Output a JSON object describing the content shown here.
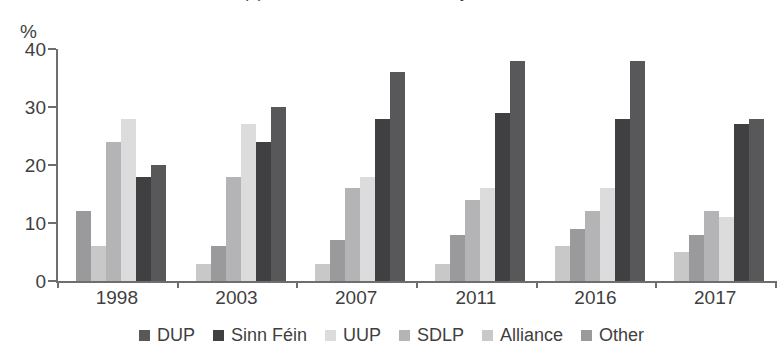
{
  "title": {
    "clipped_text": "(b) Northern Ireland Assembly elections"
  },
  "axis": {
    "y_unit_label": "%",
    "y_ticks": [
      "0",
      "10",
      "20",
      "30",
      "40"
    ],
    "x_ticks": [
      "1998",
      "2003",
      "2007",
      "2011",
      "2016",
      "2017"
    ]
  },
  "legend": {
    "items": [
      {
        "label": "DUP",
        "color": "#58585a"
      },
      {
        "label": "Sinn Féin",
        "color": "#403f41"
      },
      {
        "label": "UUP",
        "color": "#dcdcdc"
      },
      {
        "label": "SDLP",
        "color": "#b4b4b6"
      },
      {
        "label": "Alliance",
        "color": "#c8c8c8"
      },
      {
        "label": "Other",
        "color": "#9a9a9c"
      }
    ]
  },
  "chart_data": {
    "type": "bar",
    "title": "(b) Northern Ireland Assembly elections",
    "xlabel": "",
    "ylabel": "%",
    "ylim": [
      0,
      40
    ],
    "grid": false,
    "legend_position": "bottom",
    "categories": [
      "1998",
      "2003",
      "2007",
      "2011",
      "2016",
      "2017"
    ],
    "series": [
      {
        "name": "DUP",
        "color": "#58585a",
        "values": [
          18,
          26,
          30,
          30,
          29,
          28
        ]
      },
      {
        "name": "Sinn Féin",
        "color": "#403f41",
        "values": [
          17,
          23,
          26,
          27,
          24,
          28
        ]
      },
      {
        "name": "UUP",
        "color": "#dcdcdc",
        "values": [
          21,
          22,
          15,
          13,
          12,
          13
        ]
      },
      {
        "name": "SDLP",
        "color": "#b4b4b6",
        "values": [
          22,
          17,
          15,
          14,
          12,
          12
        ]
      },
      {
        "name": "Alliance",
        "color": "#c8c8c8",
        "values": [
          6,
          3,
          5,
          7,
          7,
          9
        ]
      },
      {
        "name": "Other",
        "color": "#9a9a9c",
        "values": [
          12,
          6,
          7,
          8,
          9,
          10
        ]
      }
    ],
    "groups": [
      {
        "category": "1998",
        "bars": [
          {
            "series": "Other",
            "value": 12,
            "color": "#9a9a9c"
          },
          {
            "series": "Alliance",
            "value": 6,
            "color": "#c8c8c8"
          },
          {
            "series": "SDLP",
            "value": 24,
            "color": "#b4b4b6"
          },
          {
            "series": "UUP",
            "value": 28,
            "color": "#dcdcdc"
          },
          {
            "series": "Sinn Féin",
            "value": 18,
            "color": "#403f41"
          },
          {
            "series": "DUP",
            "value": 20,
            "color": "#58585a"
          }
        ]
      },
      {
        "category": "2003",
        "bars": [
          {
            "series": "Alliance",
            "value": 3,
            "color": "#c8c8c8"
          },
          {
            "series": "Other",
            "value": 6,
            "color": "#9a9a9c"
          },
          {
            "series": "SDLP",
            "value": 18,
            "color": "#b4b4b6"
          },
          {
            "series": "UUP",
            "value": 27,
            "color": "#dcdcdc"
          },
          {
            "series": "Sinn Féin",
            "value": 24,
            "color": "#403f41"
          },
          {
            "series": "DUP",
            "value": 30,
            "color": "#58585a"
          }
        ]
      },
      {
        "category": "2007",
        "bars": [
          {
            "series": "Alliance",
            "value": 3,
            "color": "#c8c8c8"
          },
          {
            "series": "Other",
            "value": 7,
            "color": "#9a9a9c"
          },
          {
            "series": "SDLP",
            "value": 16,
            "color": "#b4b4b6"
          },
          {
            "series": "UUP",
            "value": 18,
            "color": "#dcdcdc"
          },
          {
            "series": "Sinn Féin",
            "value": 28,
            "color": "#403f41"
          },
          {
            "series": "DUP",
            "value": 36,
            "color": "#58585a"
          }
        ]
      },
      {
        "category": "2011",
        "bars": [
          {
            "series": "Alliance",
            "value": 3,
            "color": "#c8c8c8"
          },
          {
            "series": "Other",
            "value": 8,
            "color": "#9a9a9c"
          },
          {
            "series": "SDLP",
            "value": 14,
            "color": "#b4b4b6"
          },
          {
            "series": "UUP",
            "value": 16,
            "color": "#dcdcdc"
          },
          {
            "series": "Sinn Féin",
            "value": 29,
            "color": "#403f41"
          },
          {
            "series": "DUP",
            "value": 38,
            "color": "#58585a"
          }
        ]
      },
      {
        "category": "2016",
        "bars": [
          {
            "series": "Alliance",
            "value": 6,
            "color": "#c8c8c8"
          },
          {
            "series": "Other",
            "value": 9,
            "color": "#9a9a9c"
          },
          {
            "series": "SDLP",
            "value": 12,
            "color": "#b4b4b6"
          },
          {
            "series": "UUP",
            "value": 16,
            "color": "#dcdcdc"
          },
          {
            "series": "Sinn Féin",
            "value": 28,
            "color": "#403f41"
          },
          {
            "series": "DUP",
            "value": 38,
            "color": "#58585a"
          }
        ]
      },
      {
        "category": "2017",
        "bars": [
          {
            "series": "Alliance",
            "value": 5,
            "color": "#c8c8c8"
          },
          {
            "series": "Other",
            "value": 8,
            "color": "#9a9a9c"
          },
          {
            "series": "SDLP",
            "value": 12,
            "color": "#b4b4b6"
          },
          {
            "series": "UUP",
            "value": 11,
            "color": "#dcdcdc"
          },
          {
            "series": "Sinn Féin",
            "value": 27,
            "color": "#403f41"
          },
          {
            "series": "DUP",
            "value": 28,
            "color": "#58585a"
          }
        ]
      }
    ]
  }
}
